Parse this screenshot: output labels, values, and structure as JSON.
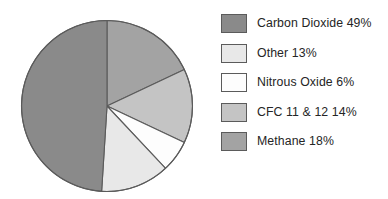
{
  "chart_data": {
    "type": "pie",
    "title": "",
    "subtitle": "",
    "xlabel": "",
    "ylabel": "",
    "legend_position": "right",
    "grid": false,
    "units": "percent",
    "start_angle_deg": 0,
    "direction": "clockwise",
    "categories": [
      "Carbon Dioxide",
      "Other",
      "Nitrous Oxide",
      "CFC 11 & 12",
      "Methane"
    ],
    "values": [
      49,
      13,
      6,
      14,
      18
    ],
    "colors": [
      "#8a8a8a",
      "#e8e8e8",
      "#fdfdfd",
      "#c4c4c4",
      "#a3a3a3"
    ],
    "slice_order_clockwise_from_top": [
      "Methane",
      "CFC 11 & 12",
      "Nitrous Oxide",
      "Other",
      "Carbon Dioxide"
    ],
    "slices": [
      {
        "label": "Carbon Dioxide",
        "value": 49,
        "display": "49%",
        "color": "#8a8a8a",
        "start_deg": 180,
        "end_deg": 356.4
      },
      {
        "label": "Other",
        "value": 13,
        "display": "13%",
        "color": "#e8e8e8",
        "start_deg": 133.2,
        "end_deg": 180
      },
      {
        "label": "Nitrous Oxide",
        "value": 6,
        "display": "6%",
        "color": "#fdfdfd",
        "start_deg": 111.6,
        "end_deg": 133.2
      },
      {
        "label": "CFC 11 & 12",
        "value": 14,
        "display": "14%",
        "color": "#c4c4c4",
        "start_deg": 64.8,
        "end_deg": 111.6
      },
      {
        "label": "Methane",
        "value": 18,
        "display": "18%",
        "color": "#a3a3a3",
        "start_deg": 0,
        "end_deg": 64.8
      }
    ]
  },
  "legend": {
    "items": [
      {
        "label": "Carbon Dioxide 49%",
        "color": "#8a8a8a"
      },
      {
        "label": "Other 13%",
        "color": "#e8e8e8"
      },
      {
        "label": "Nitrous Oxide 6%",
        "color": "#fdfdfd"
      },
      {
        "label": "CFC 11 & 12 14%",
        "color": "#c4c4c4"
      },
      {
        "label": "Methane 18%",
        "color": "#a3a3a3"
      }
    ]
  },
  "style": {
    "background": "#ffffff",
    "outline": "#5b5b5b",
    "text": "#252525"
  }
}
